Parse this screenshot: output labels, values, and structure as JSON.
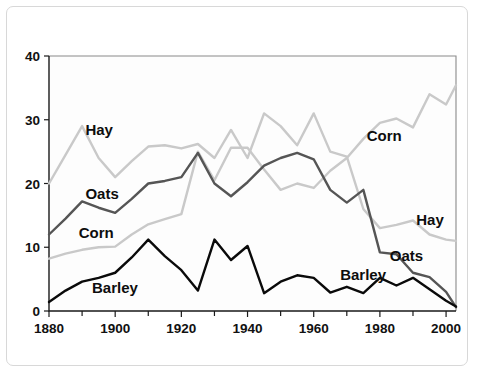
{
  "chart_data": {
    "type": "line",
    "title": "",
    "subtitle": "",
    "xlabel": "",
    "ylabel": "",
    "xlim": [
      1880,
      2003
    ],
    "ylim": [
      0,
      40
    ],
    "grid": false,
    "legend_position": "inline-labels",
    "x_ticks": [
      1880,
      1900,
      1920,
      1940,
      1960,
      1980,
      2000
    ],
    "x_tick_labels": [
      "1880",
      "1900",
      "1920",
      "1940",
      "1960",
      "1980",
      "2000"
    ],
    "x_minor_ticks": [
      1890,
      1910,
      1930,
      1950,
      1970,
      1990
    ],
    "y_ticks": [
      0,
      10,
      20,
      30,
      40
    ],
    "y_tick_labels": [
      "0",
      "10",
      "20",
      "30",
      "40"
    ],
    "x": [
      1880,
      1885,
      1890,
      1895,
      1900,
      1905,
      1910,
      1915,
      1920,
      1925,
      1930,
      1935,
      1940,
      1945,
      1950,
      1955,
      1960,
      1965,
      1970,
      1975,
      1980,
      1985,
      1990,
      1995,
      2000,
      2003
    ],
    "series": [
      {
        "name": "Hay",
        "color": "#c9c9c9",
        "stroke_width": 2.4,
        "label_left": "Hay",
        "label_right": "Hay",
        "values": [
          20.0,
          24.5,
          29.0,
          24.0,
          21.0,
          23.5,
          25.8,
          26.0,
          25.5,
          26.2,
          24.0,
          28.4,
          24.0,
          31.0,
          29.0,
          26.0,
          31.0,
          25.0,
          24.2,
          16.0,
          13.0,
          13.5,
          14.2,
          12.0,
          11.2,
          11.0
        ]
      },
      {
        "name": "Corn",
        "color": "#c9c9c9",
        "stroke_width": 2.4,
        "label_left": "Corn",
        "label_right": "Corn",
        "values": [
          8.2,
          9.0,
          9.6,
          10.0,
          10.1,
          12.0,
          13.6,
          14.4,
          15.2,
          25.0,
          20.5,
          25.6,
          25.6,
          22.2,
          19.0,
          20.0,
          19.3,
          22.0,
          24.0,
          27.0,
          29.5,
          30.2,
          28.8,
          34.0,
          32.4,
          35.4
        ]
      },
      {
        "name": "Oats",
        "color": "#555555",
        "stroke_width": 2.4,
        "label_left": "Oats",
        "label_right": "Oats",
        "values": [
          12.0,
          14.5,
          17.2,
          16.2,
          15.4,
          17.6,
          20.0,
          20.4,
          21.0,
          24.8,
          20.0,
          18.0,
          20.2,
          22.8,
          24.0,
          24.8,
          23.8,
          19.0,
          17.0,
          19.0,
          9.2,
          8.9,
          6.0,
          5.3,
          3.0,
          0.6
        ]
      },
      {
        "name": "Barley",
        "color": "#0a0a0a",
        "stroke_width": 2.4,
        "label_left": "Barley",
        "label_right": "Barley",
        "values": [
          1.4,
          3.2,
          4.6,
          5.2,
          6.0,
          8.4,
          11.2,
          8.6,
          6.4,
          3.2,
          11.2,
          8.0,
          10.2,
          2.8,
          4.6,
          5.6,
          5.2,
          2.9,
          3.8,
          2.8,
          5.2,
          4.0,
          5.2,
          3.4,
          1.6,
          0.7
        ]
      }
    ],
    "annotations": [
      {
        "text": "Hay",
        "x": 1891,
        "y": 28.4,
        "series": "Hay",
        "side": "left"
      },
      {
        "text": "Oats",
        "x": 1891,
        "y": 18.4,
        "series": "Oats",
        "side": "left"
      },
      {
        "text": "Corn",
        "x": 1889,
        "y": 12.2,
        "series": "Corn",
        "side": "left"
      },
      {
        "text": "Barley",
        "x": 1893,
        "y": 3.6,
        "series": "Barley",
        "side": "left"
      },
      {
        "text": "Corn",
        "x": 1976,
        "y": 27.4,
        "series": "Corn",
        "side": "right"
      },
      {
        "text": "Hay",
        "x": 1991,
        "y": 14.2,
        "series": "Hay",
        "side": "right"
      },
      {
        "text": "Oats",
        "x": 1983,
        "y": 8.6,
        "series": "Oats",
        "side": "right"
      },
      {
        "text": "Barley",
        "x": 1968,
        "y": 5.6,
        "series": "Barley",
        "side": "right"
      }
    ]
  },
  "figure": {
    "axis_color": "#1a1a1a",
    "frame_color": "#8a8a8a",
    "background": "#ffffff",
    "caption": ""
  }
}
